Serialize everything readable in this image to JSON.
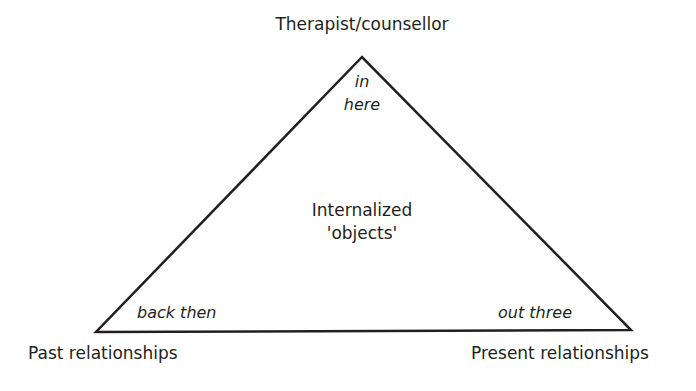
{
  "diagram": {
    "type": "triangle",
    "vertices": {
      "top": {
        "label": "Therapist/counsellor",
        "corner_text": [
          "in",
          "here"
        ]
      },
      "left": {
        "label": "Past relationships",
        "corner_text": "back then"
      },
      "right": {
        "label": "Present relationships",
        "corner_text": "out three"
      }
    },
    "center": {
      "lines": [
        "Internalized",
        "'objects'"
      ]
    },
    "colors": {
      "stroke": "#231f20",
      "text": "#231f20",
      "background": "#ffffff"
    },
    "geometry": {
      "apex": [
        362,
        57
      ],
      "bottom_left": [
        96,
        332
      ],
      "bottom_right": [
        631,
        330
      ]
    }
  }
}
